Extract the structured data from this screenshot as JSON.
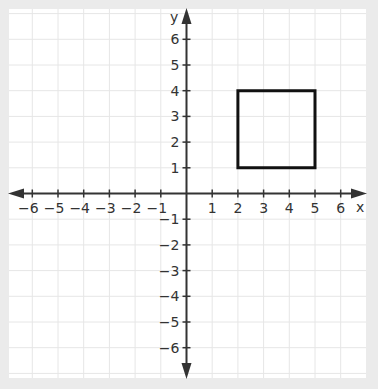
{
  "chart_data": {
    "type": "scatter",
    "title": "",
    "xlabel": "x",
    "ylabel": "y",
    "xlim": [
      -6.7,
      6.9
    ],
    "ylim": [
      -7.1,
      7.1
    ],
    "grid": true,
    "x_ticks": [
      -6,
      -5,
      -4,
      -3,
      -2,
      -1,
      1,
      2,
      3,
      4,
      5,
      6
    ],
    "y_ticks": [
      -6,
      -5,
      -4,
      -3,
      -2,
      -1,
      1,
      2,
      3,
      4,
      5,
      6
    ],
    "x_tick_labels": [
      "−6",
      "−5",
      "−4",
      "−3",
      "−2",
      "−1",
      "1",
      "2",
      "3",
      "4",
      "5",
      "6"
    ],
    "y_tick_labels": [
      "−6",
      "−5",
      "−4",
      "−3",
      "−2",
      "−1",
      "1",
      "2",
      "3",
      "4",
      "5",
      "6"
    ],
    "shapes": [
      {
        "name": "square",
        "type": "polygon",
        "vertices": [
          [
            2,
            1
          ],
          [
            5,
            1
          ],
          [
            5,
            4
          ],
          [
            2,
            4
          ]
        ]
      }
    ]
  },
  "colors": {
    "background": "#ebebeb",
    "plot_area": "#ffffff",
    "grid": "#e6e6e6",
    "axis": "#333333",
    "shape": "#111111",
    "text": "#333333"
  }
}
